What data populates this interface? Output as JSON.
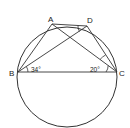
{
  "diagram": {
    "type": "circle-geometry",
    "points": {
      "A": {
        "label": "A",
        "x": 52,
        "y": 24
      },
      "D": {
        "label": "D",
        "x": 87,
        "y": 26
      },
      "B": {
        "label": "B",
        "x": 18,
        "y": 72
      },
      "C": {
        "label": "C",
        "x": 117,
        "y": 72
      }
    },
    "circle": {
      "cx": 67,
      "cy": 77,
      "r": 50
    },
    "segments": [
      "BA",
      "BD",
      "AC",
      "DC",
      "AD",
      "BC"
    ],
    "angles": {
      "B": {
        "label": "34°",
        "between": "DBC"
      },
      "C": {
        "label": "20°",
        "between": "ACB"
      },
      "D_mark": {
        "label": "",
        "between": "ADB"
      },
      "C_mark": {
        "label": "",
        "between": "DCA"
      }
    },
    "colors": {
      "stroke": "#333333",
      "background": "#ffffff"
    }
  }
}
